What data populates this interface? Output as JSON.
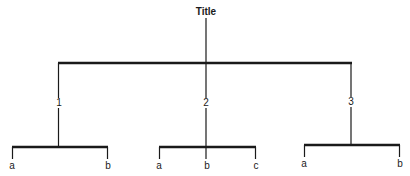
{
  "diagram": {
    "type": "tree",
    "title": "Title",
    "colors": {
      "line": "#1a1a1a",
      "background": "#ffffff"
    },
    "root": {
      "label": "Title",
      "children": [
        {
          "label": "1",
          "children": [
            {
              "label": "a"
            },
            {
              "label": "b"
            }
          ]
        },
        {
          "label": "2",
          "children": [
            {
              "label": "a"
            },
            {
              "label": "b"
            },
            {
              "label": "c"
            }
          ]
        },
        {
          "label": "3",
          "children": [
            {
              "label": "a"
            },
            {
              "label": "b"
            }
          ]
        }
      ]
    }
  },
  "labels": {
    "title": "Title",
    "branch1": "1",
    "branch2": "2",
    "branch3": "3",
    "b1_leaf1": "a",
    "b1_leaf2": "b",
    "b2_leaf1": "a",
    "b2_leaf2": "b",
    "b2_leaf3": "c",
    "b3_leaf1": "a",
    "b3_leaf2": "b"
  }
}
